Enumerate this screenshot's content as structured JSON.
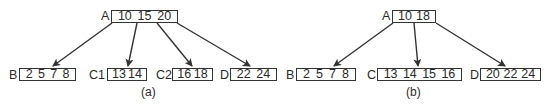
{
  "diagram_type": "B-tree node split",
  "panels": [
    {
      "caption": "(a)",
      "root": {
        "label": "A",
        "keys": [
          "10",
          "15",
          "20"
        ]
      },
      "children": [
        {
          "label": "B",
          "keys": [
            "2",
            "5",
            "7",
            "8"
          ]
        },
        {
          "label": "C1",
          "keys": [
            "13",
            "14"
          ]
        },
        {
          "label": "C2",
          "keys": [
            "16",
            "18"
          ]
        },
        {
          "label": "D",
          "keys": [
            "22",
            "24"
          ]
        }
      ]
    },
    {
      "caption": "(b)",
      "root": {
        "label": "A",
        "keys": [
          "10",
          "18"
        ]
      },
      "children": [
        {
          "label": "B",
          "keys": [
            "2",
            "5",
            "7",
            "8"
          ]
        },
        {
          "label": "C",
          "keys": [
            "13",
            "14",
            "15",
            "16"
          ]
        },
        {
          "label": "D",
          "keys": [
            "20",
            "22",
            "24"
          ]
        }
      ]
    }
  ],
  "colors": {
    "stroke": "#333333",
    "text": "#2a2a2a",
    "background": "#ffffff"
  }
}
